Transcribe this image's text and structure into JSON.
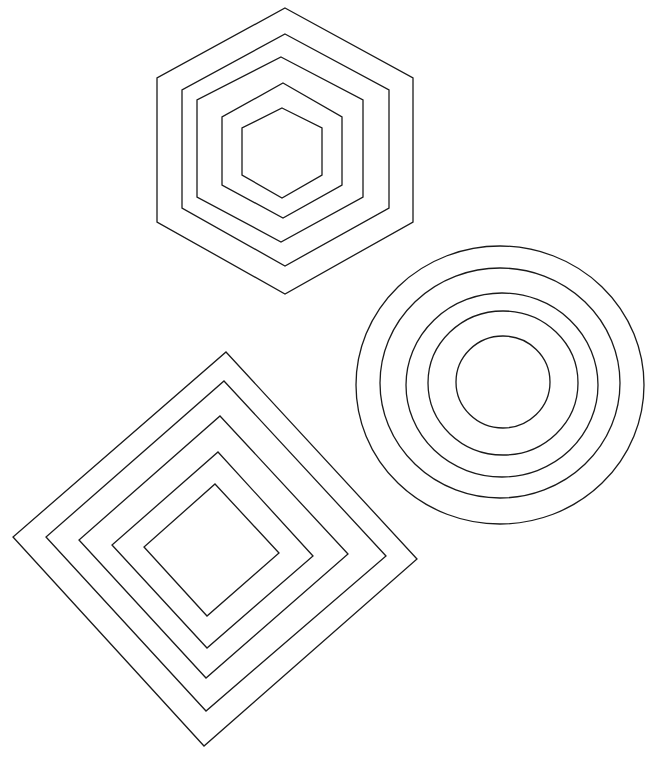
{
  "canvas": {
    "width": 651,
    "height": 767,
    "background": "#ffffff",
    "stroke": "#1a1a1a"
  },
  "figures": {
    "hexagons": {
      "name": "concentric-hexagons",
      "rings": [
        {
          "points": "285,8 413,78 413,222 285,294 157,222 157,78"
        },
        {
          "points": "285,34 389,90 389,208 285,266 182,208 182,90"
        },
        {
          "points": "281,57 363,100 363,197 281,242 197,197 197,100"
        },
        {
          "points": "283,83 342,117 342,185 283,218 222,185 222,117"
        },
        {
          "points": "282,108 322,128 322,175 282,198 242,175 242,128"
        }
      ]
    },
    "circles": {
      "name": "concentric-circles",
      "rings": [
        {
          "cx": 500,
          "cy": 385,
          "rx": 144,
          "ry": 139
        },
        {
          "cx": 500,
          "cy": 383,
          "rx": 120,
          "ry": 115
        },
        {
          "cx": 502,
          "cy": 385,
          "rx": 96,
          "ry": 92
        },
        {
          "cx": 503,
          "cy": 383,
          "rx": 75,
          "ry": 72
        },
        {
          "cx": 503,
          "cy": 382,
          "rx": 47,
          "ry": 46
        }
      ]
    },
    "diamonds": {
      "name": "concentric-diamonds",
      "rings": [
        {
          "points": "226,352 417,559 204,746 13,537"
        },
        {
          "points": "224,381 386,556 206,711 46,537"
        },
        {
          "points": "220,416 348,554 206,678 79,540"
        },
        {
          "points": "218,452 313,556 207,648 112,545"
        },
        {
          "points": "215,484 279,553 207,616 144,547"
        }
      ]
    }
  }
}
